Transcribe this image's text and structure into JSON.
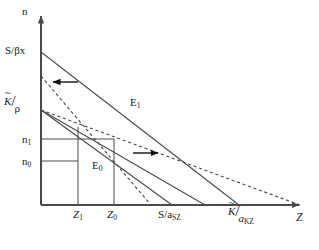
{
  "figure": {
    "background": "#ffffff",
    "line_color": "#4a4a4a",
    "text_color": "#1b1b1b",
    "width": 319,
    "height": 250
  },
  "axes": {
    "y_label": "n",
    "x_label": "Z",
    "origin": {
      "x": 41,
      "y": 205
    },
    "y_top": {
      "x": 41,
      "y": 14
    },
    "x_right": {
      "x": 302,
      "y": 205
    }
  },
  "y_ticks": [
    {
      "label": "S/βx",
      "value_y": 52,
      "kind": "text"
    },
    {
      "label": "K̃/ρ",
      "value_y": 110,
      "kind": "fraction",
      "numerator": "K",
      "tilde": true,
      "denominator": "ρ"
    },
    {
      "label": "n1",
      "value_y": 139,
      "kind": "subscript",
      "base": "n",
      "sub": "1"
    },
    {
      "label": "n0",
      "value_y": 161,
      "kind": "subscript",
      "base": "n",
      "sub": "0"
    }
  ],
  "x_ticks": [
    {
      "label": "Z1",
      "value_x": 78,
      "kind": "subscript",
      "base": "Z",
      "sub": "1"
    },
    {
      "label": "Z0",
      "value_x": 114,
      "kind": "subscript",
      "base": "Z",
      "sub": "0"
    },
    {
      "label": "S/aSZ",
      "value_x": 172,
      "kind": "text",
      "base": "S/a",
      "sub": "SZ"
    },
    {
      "label": "K̃/aKZ",
      "value_x": 239,
      "kind": "fraction",
      "numerator": "K",
      "tilde": true,
      "denominator": "a",
      "denominator_sub": "KZ"
    }
  ],
  "equilibria": [
    {
      "name": "E1",
      "base": "E",
      "sub": "1",
      "point": {
        "x": 114,
        "y": 148
      }
    },
    {
      "name": "E0",
      "base": "E",
      "sub": "0",
      "point": {
        "x": 78,
        "y": 127
      }
    }
  ],
  "curves": [
    {
      "name": "solid-S-line-outer",
      "style": "solid",
      "from": {
        "x": 41,
        "y": 52
      },
      "to": {
        "x": 239,
        "y": 205
      }
    },
    {
      "name": "solid-K-line",
      "style": "solid",
      "from": {
        "x": 41,
        "y": 110
      },
      "to": {
        "x": 172,
        "y": 205
      }
    },
    {
      "name": "dashed-S-line-shifted",
      "style": "dashed",
      "from": {
        "x": 41,
        "y": 76
      },
      "to": {
        "x": 151,
        "y": 205
      }
    },
    {
      "name": "dashed-K-line-shifted",
      "style": "dashed",
      "from": {
        "x": 41,
        "y": 110
      },
      "to": {
        "x": 302,
        "y": 205
      }
    },
    {
      "name": "solid-inner-line",
      "style": "solid",
      "from": {
        "x": 41,
        "y": 110
      },
      "to": {
        "x": 205,
        "y": 205
      }
    }
  ],
  "guide_lines": [
    {
      "name": "guide-n1-horizontal",
      "from": {
        "x": 41,
        "y": 139
      },
      "to": {
        "x": 114,
        "y": 139
      }
    },
    {
      "name": "guide-n0-horizontal",
      "from": {
        "x": 41,
        "y": 161
      },
      "to": {
        "x": 78,
        "y": 161
      }
    },
    {
      "name": "guide-Z1-vertical",
      "from": {
        "x": 78,
        "y": 205
      },
      "to": {
        "x": 78,
        "y": 127
      }
    },
    {
      "name": "guide-Z0-vertical",
      "from": {
        "x": 114,
        "y": 205
      },
      "to": {
        "x": 114,
        "y": 139
      }
    }
  ],
  "arrows": [
    {
      "name": "arrow-left",
      "direction": "left",
      "from": {
        "x": 78,
        "y": 82
      },
      "to": {
        "x": 50,
        "y": 82
      }
    },
    {
      "name": "arrow-right",
      "direction": "right",
      "from": {
        "x": 133,
        "y": 153
      },
      "to": {
        "x": 161,
        "y": 153
      }
    }
  ]
}
